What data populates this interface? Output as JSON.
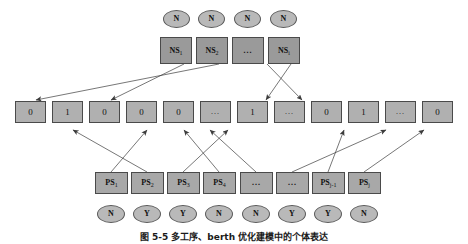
{
  "figure": {
    "caption": "图 5-5   多工序、berth 优化建模中的个体表达",
    "colors": {
      "ellipse_fill": "#b9b9b9",
      "box_dark_fill": "#9a9a9a",
      "box_mid_fill": "#a8a8a8",
      "box_light_fill": "#b0b0b0",
      "stroke": "#4a4a4a",
      "edge": "#3c3c3c",
      "background": "#ffffff"
    }
  },
  "rows": {
    "top_states": {
      "name": "top-state-row",
      "items": [
        {
          "label": "N"
        },
        {
          "label": "N"
        },
        {
          "label": "N"
        },
        {
          "label": "N"
        }
      ]
    },
    "ns_boxes": {
      "name": "ns-row",
      "items": [
        {
          "base": "NS",
          "sub": "1",
          "ellipsis": false
        },
        {
          "base": "NS",
          "sub": "2",
          "ellipsis": false
        },
        {
          "base": "",
          "sub": "",
          "ellipsis": true,
          "label": "..."
        },
        {
          "base": "NS",
          "sub": "i",
          "ellipsis": false
        }
      ]
    },
    "binary_boxes": {
      "name": "binary-row",
      "items": [
        {
          "label": "0"
        },
        {
          "label": "1"
        },
        {
          "label": "0"
        },
        {
          "label": "0"
        },
        {
          "label": "0"
        },
        {
          "label": "..."
        },
        {
          "label": "1"
        },
        {
          "label": "..."
        },
        {
          "label": "0"
        },
        {
          "label": "1"
        },
        {
          "label": "..."
        },
        {
          "label": "0"
        }
      ]
    },
    "ps_boxes": {
      "name": "ps-row",
      "items": [
        {
          "base": "PS",
          "sub": "1",
          "ellipsis": false
        },
        {
          "base": "PS",
          "sub": "2",
          "ellipsis": false
        },
        {
          "base": "PS",
          "sub": "3",
          "ellipsis": false
        },
        {
          "base": "PS",
          "sub": "4",
          "ellipsis": false
        },
        {
          "base": "",
          "sub": "",
          "ellipsis": true,
          "label": "..."
        },
        {
          "base": "",
          "sub": "",
          "ellipsis": true,
          "label": "..."
        },
        {
          "base": "PS",
          "sub": "j-1",
          "ellipsis": false
        },
        {
          "base": "PS",
          "sub": "j",
          "ellipsis": false
        }
      ]
    },
    "bottom_states": {
      "name": "bottom-state-row",
      "items": [
        {
          "label": "N"
        },
        {
          "label": "Y"
        },
        {
          "label": "Y"
        },
        {
          "label": "N"
        },
        {
          "label": "N"
        },
        {
          "label": "Y"
        },
        {
          "label": "Y"
        },
        {
          "label": "N"
        }
      ]
    }
  },
  "edges": {
    "ns_to_binary": [
      {
        "from": "ns-box-1",
        "to": "binary-box-3"
      },
      {
        "from": "ns-box-2",
        "to": "binary-box-1"
      },
      {
        "from": "ns-box-3",
        "to": "binary-box-9"
      },
      {
        "from": "ns-box-4",
        "to": "binary-box-8"
      }
    ],
    "ps_to_binary": [
      {
        "from": "ps-box-1",
        "to": "binary-box-4"
      },
      {
        "from": "ps-box-2",
        "to": "binary-box-2"
      },
      {
        "from": "ps-box-3",
        "to": "binary-box-7"
      },
      {
        "from": "ps-box-4",
        "to": "binary-box-5"
      },
      {
        "from": "ps-box-5",
        "to": "binary-box-6"
      },
      {
        "from": "ps-box-6",
        "to": "binary-box-11"
      },
      {
        "from": "ps-box-7",
        "to": "binary-box-10"
      },
      {
        "from": "ps-box-8",
        "to": "binary-box-12"
      }
    ]
  }
}
